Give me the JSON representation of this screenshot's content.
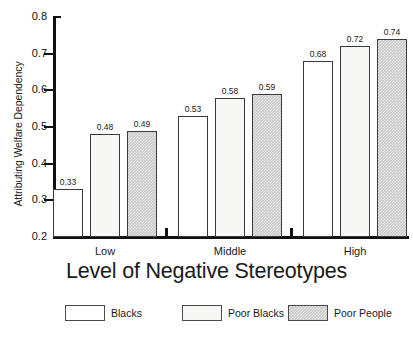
{
  "chart_data": {
    "type": "bar",
    "title": "",
    "subtitle": "",
    "xlabel": "Level of Negative Stereotypes",
    "ylabel": "Attributing Welfare Dependency",
    "categories": [
      "Low",
      "Middle",
      "High"
    ],
    "series": [
      {
        "name": "Blacks",
        "values": [
          0.33,
          0.53,
          0.68
        ],
        "swatch": "white"
      },
      {
        "name": "Poor Blacks",
        "values": [
          0.48,
          0.58,
          0.72
        ],
        "swatch": "off-white"
      },
      {
        "name": "Poor People",
        "values": [
          0.49,
          0.59,
          0.74
        ],
        "swatch": "gray-hatched"
      }
    ],
    "data_labels": [
      [
        "0.33",
        "0.48",
        "0.49"
      ],
      [
        "0.53",
        "0.58",
        "0.59"
      ],
      [
        "0.68",
        "0.72",
        "0.74"
      ]
    ],
    "ylim": [
      0.2,
      0.8
    ],
    "ytick_values": [
      0.2,
      0.3,
      0.4,
      0.5,
      0.6,
      0.7,
      0.8
    ],
    "ytick_labels": [
      "0.2",
      "0.3",
      "0.4",
      "0.5",
      "0.6",
      "0.7",
      "0.8"
    ],
    "grid": false,
    "legend_position": "bottom",
    "colors": {
      "series_blacks": "#ffffff",
      "series_poor_blacks": "#f7f7f5",
      "series_poor_people": "#c9c9c9",
      "axis": "#111111",
      "text": "#1a1a1a",
      "background": "#ffffff"
    }
  },
  "legend": {
    "items": [
      {
        "label": "Blacks"
      },
      {
        "label": "Poor Blacks"
      },
      {
        "label": "Poor People"
      }
    ]
  }
}
